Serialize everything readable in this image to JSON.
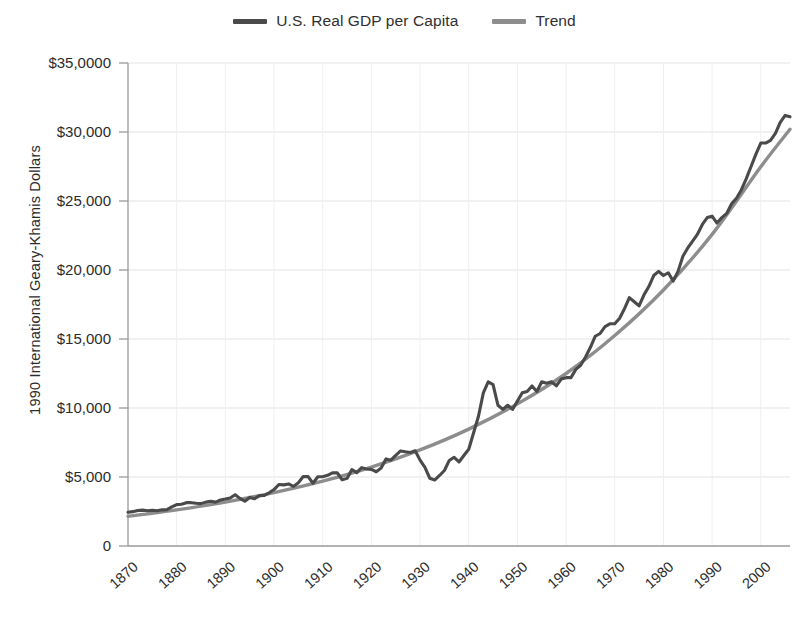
{
  "chart_data": {
    "type": "line",
    "title": "",
    "xlabel": "",
    "ylabel": "1990 International Geary-Khamis Dollars",
    "xlim": [
      1870,
      2006
    ],
    "ylim": [
      0,
      35000
    ],
    "grid": true,
    "legend_position": "top-center",
    "y_ticks": [
      0,
      5000,
      10000,
      15000,
      20000,
      25000,
      30000,
      35000
    ],
    "y_tick_labels": [
      "0",
      "$5,000",
      "$10,000",
      "$15,000",
      "$20,000",
      "$25,000",
      "$30,000",
      "$35,0000"
    ],
    "x_ticks": [
      1870,
      1880,
      1890,
      1900,
      1910,
      1920,
      1930,
      1940,
      1950,
      1960,
      1970,
      1980,
      1990,
      2000
    ],
    "x_tick_labels": [
      "1870",
      "1880",
      "1890",
      "1900",
      "1910",
      "1920",
      "1930",
      "1940",
      "1950",
      "1960",
      "1970",
      "1980",
      "1990",
      "2000"
    ],
    "colors": {
      "series": "#4a4a4a",
      "trend": "#8d8d8d",
      "grid": "#e3e3e3",
      "axis": "#9a9a9a",
      "background": "#ffffff"
    },
    "series": [
      {
        "name": "U.S. Real GDP per Capita",
        "color": "#4a4a4a",
        "x": [
          1870,
          1871,
          1872,
          1873,
          1874,
          1875,
          1876,
          1877,
          1878,
          1879,
          1880,
          1881,
          1882,
          1883,
          1884,
          1885,
          1886,
          1887,
          1888,
          1889,
          1890,
          1891,
          1892,
          1893,
          1894,
          1895,
          1896,
          1897,
          1898,
          1899,
          1900,
          1901,
          1902,
          1903,
          1904,
          1905,
          1906,
          1907,
          1908,
          1909,
          1910,
          1911,
          1912,
          1913,
          1914,
          1915,
          1916,
          1917,
          1918,
          1919,
          1920,
          1921,
          1922,
          1923,
          1924,
          1925,
          1926,
          1927,
          1928,
          1929,
          1930,
          1931,
          1932,
          1933,
          1934,
          1935,
          1936,
          1937,
          1938,
          1939,
          1940,
          1941,
          1942,
          1943,
          1944,
          1945,
          1946,
          1947,
          1948,
          1949,
          1950,
          1951,
          1952,
          1953,
          1954,
          1955,
          1956,
          1957,
          1958,
          1959,
          1960,
          1961,
          1962,
          1963,
          1964,
          1965,
          1966,
          1967,
          1968,
          1969,
          1970,
          1971,
          1972,
          1973,
          1974,
          1975,
          1976,
          1977,
          1978,
          1979,
          1980,
          1981,
          1982,
          1983,
          1984,
          1985,
          1986,
          1987,
          1988,
          1989,
          1990,
          1991,
          1992,
          1993,
          1994,
          1995,
          1996,
          1997,
          1998,
          1999,
          2000,
          2001,
          2002,
          2003,
          2004,
          2005,
          2006
        ],
        "y": [
          2445,
          2490,
          2570,
          2600,
          2560,
          2590,
          2560,
          2620,
          2630,
          2830,
          3000,
          3030,
          3140,
          3140,
          3100,
          3070,
          3180,
          3240,
          3180,
          3330,
          3400,
          3480,
          3720,
          3450,
          3240,
          3520,
          3420,
          3650,
          3660,
          3860,
          4090,
          4460,
          4430,
          4500,
          4320,
          4590,
          5030,
          5030,
          4550,
          5020,
          5020,
          5120,
          5300,
          5300,
          4800,
          4900,
          5540,
          5320,
          5680,
          5580,
          5550,
          5380,
          5650,
          6310,
          6220,
          6570,
          6890,
          6830,
          6780,
          6900,
          6220,
          5690,
          4910,
          4780,
          5110,
          5470,
          6200,
          6430,
          6090,
          6560,
          7010,
          8210,
          9400,
          11100,
          11900,
          11700,
          10200,
          9900,
          10200,
          9900,
          10500,
          11100,
          11200,
          11600,
          11200,
          11900,
          11800,
          11900,
          11600,
          12100,
          12200,
          12200,
          12800,
          13100,
          13700,
          14400,
          15200,
          15400,
          15900,
          16100,
          16100,
          16500,
          17200,
          18000,
          17700,
          17400,
          18200,
          18800,
          19600,
          19900,
          19600,
          19800,
          19200,
          19900,
          21000,
          21600,
          22100,
          22600,
          23300,
          23800,
          23900,
          23400,
          23800,
          24100,
          24800,
          25200,
          25800,
          26600,
          27500,
          28400,
          29200,
          29200,
          29400,
          29900,
          30700,
          31200,
          31100
        ],
        "line_width": 3.1
      },
      {
        "name": "Trend",
        "color": "#8d8d8d",
        "x": [
          1870,
          1880,
          1890,
          1900,
          1910,
          1920,
          1930,
          1940,
          1950,
          1960,
          1970,
          1980,
          1990,
          2000,
          2006
        ],
        "y": [
          2150,
          2620,
          3180,
          3870,
          4700,
          5720,
          6960,
          8470,
          10300,
          12500,
          15250,
          18550,
          22580,
          27480,
          30200
        ],
        "line_width": 3.4,
        "description": "Exponential trend fitted through series"
      }
    ]
  },
  "legend": {
    "items": [
      {
        "label": "U.S. Real GDP per Capita",
        "color": "#4a4a4a"
      },
      {
        "label": "Trend",
        "color": "#8d8d8d"
      }
    ]
  },
  "axes": {
    "y_title": "1990 International Geary-Khamis Dollars"
  }
}
